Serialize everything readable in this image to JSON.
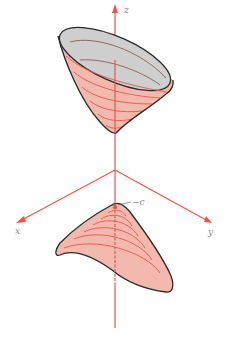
{
  "figure": {
    "type": "hyperboloid-of-two-sheets",
    "axes": {
      "z_label": "z",
      "x_label": "x",
      "y_label": "y"
    },
    "annotations": {
      "vertex_label": "−c"
    },
    "colors": {
      "axis": "#e8574a",
      "surface_fill": "#f4b9ae",
      "surface_inner": "#cfcfcf",
      "level_curves": "#e4574a",
      "outline": "#2a2a2a",
      "label": "#8a8a8a"
    }
  }
}
